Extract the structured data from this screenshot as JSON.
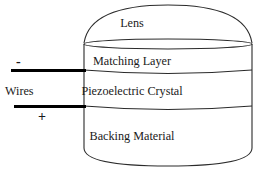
{
  "diagram": {
    "layers": [
      {
        "id": "lens",
        "label": "Lens"
      },
      {
        "id": "matching_layer",
        "label": "Matching Layer"
      },
      {
        "id": "piezoelectric_crystal",
        "label": "Piezoelectric Crystal"
      },
      {
        "id": "backing_material",
        "label": "Backing Material"
      }
    ],
    "annotations": {
      "wires_label": "Wires",
      "negative_terminal": "-",
      "positive_terminal": "+"
    },
    "colors": {
      "outline": "#2b2b2b",
      "wire": "#000000",
      "text": "#1a1a1a",
      "background": "#ffffff"
    }
  }
}
